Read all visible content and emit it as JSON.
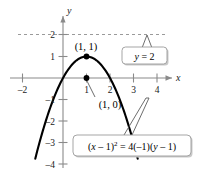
{
  "figure": {
    "axis_labels": {
      "x": "x",
      "y": "y"
    },
    "x_ticks": [
      {
        "value": -2,
        "label": "–2"
      },
      {
        "value": 1,
        "label": "1"
      },
      {
        "value": 2,
        "label": "2"
      },
      {
        "value": 3,
        "label": "3"
      },
      {
        "value": 4,
        "label": "4"
      }
    ],
    "y_ticks": [
      {
        "value": 2,
        "label": "2"
      },
      {
        "value": 1,
        "label": "1"
      },
      {
        "value": -1,
        "label": "–1"
      },
      {
        "value": -2,
        "label": "–2"
      },
      {
        "value": -3,
        "label": "–3"
      },
      {
        "value": -4,
        "label": "–4"
      }
    ],
    "points": [
      {
        "name": "vertex",
        "x": 1,
        "y": 1,
        "label": "(1, 1)"
      },
      {
        "name": "focus-or-intercept",
        "x": 1,
        "y": 0,
        "label": "(1, 0)"
      }
    ],
    "directrix": {
      "label": "y = 2",
      "y": 2,
      "style": "dashed"
    },
    "equation_label": "(x – 1)² = 4(–1)(y – 1)",
    "equation_parts": {
      "lhs_open": "(",
      "lhs_var": "x",
      "lhs_rest": " – 1)",
      "exponent": "2",
      "rhs": " = 4(–1)(",
      "rhs_var": "y",
      "rhs_end": " – 1)"
    },
    "directrix_parts": {
      "var": "y",
      "rest": " = 2"
    }
  },
  "chart_data": {
    "type": "line",
    "title": "",
    "xlabel": "x",
    "ylabel": "y",
    "xlim": [
      -2.4,
      4.6
    ],
    "ylim": [
      -4.6,
      2.6
    ],
    "grid": false,
    "legend": "none",
    "equation": "(x - 1)^2 = 4(-1)(y - 1)",
    "function": "y = 1 - (x - 1)^2",
    "series": [
      {
        "name": "parabola",
        "x": [
          -1.1,
          -0.75,
          -0.5,
          -0.25,
          0,
          0.25,
          0.5,
          0.75,
          1,
          1.25,
          1.5,
          1.75,
          2,
          2.25,
          2.5,
          2.75,
          3,
          3.25,
          3.5
        ],
        "y": [
          -3.41,
          -2.0625,
          -1.25,
          -0.5625,
          0,
          0.4375,
          0.75,
          0.9375,
          1,
          0.9375,
          0.75,
          0.4375,
          0,
          -0.5625,
          -1.25,
          -2.0625,
          -3,
          -4.0625,
          -5.25
        ]
      }
    ],
    "annotations": [
      {
        "text": "(1, 1)",
        "x": 1,
        "y": 1,
        "type": "point-label"
      },
      {
        "text": "(1, 0)",
        "x": 1,
        "y": 0,
        "type": "point-label"
      },
      {
        "text": "y = 2",
        "x": 3.2,
        "y": 1.3,
        "type": "callout"
      },
      {
        "text": "(x – 1)² = 4(–1)(y – 1)",
        "x": 2.6,
        "y": -3.0,
        "type": "callout"
      }
    ],
    "reference_lines": [
      {
        "name": "directrix",
        "orientation": "horizontal",
        "value": 2,
        "style": "dashed"
      }
    ]
  }
}
